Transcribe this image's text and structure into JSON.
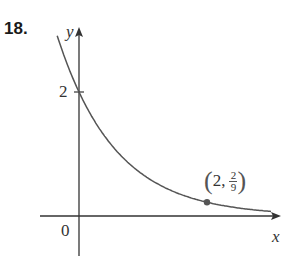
{
  "problem": {
    "number": "18."
  },
  "chart_data": {
    "type": "line",
    "title": "",
    "xlabel": "x",
    "ylabel": "y",
    "function": "y = 2(1/3)^x",
    "series": [
      {
        "name": "curve",
        "x": [
          -0.35,
          0,
          0.5,
          1,
          1.5,
          2,
          2.5,
          3.05
        ],
        "values": [
          2.94,
          2,
          1.155,
          0.667,
          0.385,
          0.222,
          0.128,
          0.071
        ]
      }
    ],
    "points": [
      {
        "x": 2,
        "y": 0.2222,
        "label": "(2, 2/9)"
      }
    ],
    "yticks": [
      {
        "value": 2,
        "label": "2"
      }
    ],
    "origin_label": "0",
    "xlim": [
      -0.6,
      3.15
    ],
    "ylim": [
      -0.6,
      3.0
    ],
    "grid": false,
    "legend": "none",
    "colors": {
      "curve": "#555555",
      "axes": "#333333",
      "point": "#555555"
    }
  },
  "labels": {
    "y_axis": "y",
    "x_axis": "x",
    "origin": "0",
    "tick_2": "2",
    "point_x": "2,",
    "point_num": "2",
    "point_den": "9",
    "paren_open": "(",
    "paren_close": ")"
  }
}
